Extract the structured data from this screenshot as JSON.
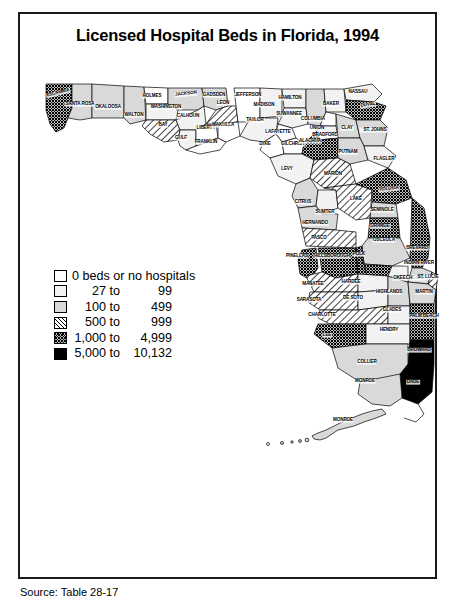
{
  "figure": {
    "title": "Licensed Hospital Beds in Florida, 1994",
    "source_note": "Source: Table 28-17"
  },
  "legend": {
    "name": "map-legend",
    "entries": [
      {
        "swatch": "white",
        "label": "0 beds or no hospitals",
        "from": "",
        "to": "",
        "single": true
      },
      {
        "swatch": "very-light-gray",
        "label": "27 to 99",
        "from": "27 to",
        "to": "99",
        "single": false
      },
      {
        "swatch": "light-gray",
        "label": "100 to 499",
        "from": "100 to",
        "to": "499",
        "single": false
      },
      {
        "swatch": "diagonal-hatch",
        "label": "500 to 999",
        "from": "500 to",
        "to": "999",
        "single": false
      },
      {
        "swatch": "crosshatch",
        "label": "1,000 to 4,999",
        "from": "1,000 to",
        "to": "4,999",
        "single": false
      },
      {
        "swatch": "black",
        "label": "5,000 to 10,132",
        "from": "5,000 to",
        "to": "10,132",
        "single": false
      }
    ]
  },
  "colors": {
    "class0": "#ffffff",
    "class1": "#f2f2f2",
    "class2": "#d9d9d9",
    "class5": "#000000",
    "border": "#1a1a1a"
  },
  "chart_data": {
    "type": "map",
    "title": "Licensed Hospital Beds in Florida, 1994",
    "region": "Florida",
    "unit": "licensed hospital beds",
    "classes": [
      {
        "index": 0,
        "range": "0 beds or no hospitals",
        "min": 0,
        "max": 0,
        "fill": "white"
      },
      {
        "index": 1,
        "range": "27 to 99",
        "min": 27,
        "max": 99,
        "fill": "very-light-gray"
      },
      {
        "index": 2,
        "range": "100 to 499",
        "min": 100,
        "max": 499,
        "fill": "light-gray"
      },
      {
        "index": 3,
        "range": "500 to 999",
        "min": 500,
        "max": 999,
        "fill": "diagonal-hatch"
      },
      {
        "index": 4,
        "range": "1,000 to 4,999",
        "min": 1000,
        "max": 4999,
        "fill": "crosshatch"
      },
      {
        "index": 5,
        "range": "5,000 to 10,132",
        "min": 5000,
        "max": 10132,
        "fill": "black"
      }
    ],
    "counties": [
      {
        "name": "ESCAMBIA",
        "class": 4
      },
      {
        "name": "SANTA ROSA",
        "class": 2
      },
      {
        "name": "OKALOOSA",
        "class": 2
      },
      {
        "name": "WALTON",
        "class": 2
      },
      {
        "name": "HOLMES",
        "class": 0
      },
      {
        "name": "WASHINGTON",
        "class": 1
      },
      {
        "name": "JACKSON",
        "class": 2
      },
      {
        "name": "BAY",
        "class": 3
      },
      {
        "name": "CALHOUN",
        "class": 1
      },
      {
        "name": "GULF",
        "class": 1
      },
      {
        "name": "LIBERTY",
        "class": 0
      },
      {
        "name": "FRANKLIN",
        "class": 0
      },
      {
        "name": "GADSDEN",
        "class": 2
      },
      {
        "name": "LEON",
        "class": 3
      },
      {
        "name": "WAKULLA",
        "class": 0
      },
      {
        "name": "JEFFERSON",
        "class": 0
      },
      {
        "name": "MADISON",
        "class": 1
      },
      {
        "name": "TAYLOR",
        "class": 1
      },
      {
        "name": "HAMILTON",
        "class": 1
      },
      {
        "name": "SUWANNEE",
        "class": 1
      },
      {
        "name": "LAFAYETTE",
        "class": 0
      },
      {
        "name": "DIXIE",
        "class": 0
      },
      {
        "name": "COLUMBIA",
        "class": 2
      },
      {
        "name": "BAKER",
        "class": 1
      },
      {
        "name": "NASSAU",
        "class": 1
      },
      {
        "name": "DUVAL",
        "class": 4
      },
      {
        "name": "UNION",
        "class": 0
      },
      {
        "name": "BRADFORD",
        "class": 1
      },
      {
        "name": "CLAY",
        "class": 2
      },
      {
        "name": "ST. JOHNS",
        "class": 2
      },
      {
        "name": "ALACHUA",
        "class": 4
      },
      {
        "name": "GILCHRIST",
        "class": 0
      },
      {
        "name": "LEVY",
        "class": 1
      },
      {
        "name": "PUTNAM",
        "class": 2
      },
      {
        "name": "FLAGLER",
        "class": 1
      },
      {
        "name": "MARION",
        "class": 3
      },
      {
        "name": "CITRUS",
        "class": 2
      },
      {
        "name": "SUMTER",
        "class": 1
      },
      {
        "name": "HERNANDO",
        "class": 2
      },
      {
        "name": "LAKE",
        "class": 3
      },
      {
        "name": "VOLUSIA",
        "class": 4
      },
      {
        "name": "SEMINOLE",
        "class": 2
      },
      {
        "name": "ORANGE",
        "class": 4
      },
      {
        "name": "OSCEOLA",
        "class": 2
      },
      {
        "name": "PASCO",
        "class": 3
      },
      {
        "name": "PINELLAS",
        "class": 4
      },
      {
        "name": "HILLSBOROUGH",
        "class": 4
      },
      {
        "name": "POLK",
        "class": 4
      },
      {
        "name": "BREVARD",
        "class": 4
      },
      {
        "name": "INDIAN RIVER",
        "class": 2
      },
      {
        "name": "OKEECHOBEE",
        "class": 1
      },
      {
        "name": "ST. LUCIE",
        "class": 3
      },
      {
        "name": "MARTIN",
        "class": 2
      },
      {
        "name": "MANATEE",
        "class": 3
      },
      {
        "name": "SARASOTA",
        "class": 3
      },
      {
        "name": "HARDEE",
        "class": 1
      },
      {
        "name": "DE SOTO",
        "class": 1
      },
      {
        "name": "HIGHLANDS",
        "class": 2
      },
      {
        "name": "CHARLOTTE",
        "class": 3
      },
      {
        "name": "GLADES",
        "class": 1
      },
      {
        "name": "LEE",
        "class": 4
      },
      {
        "name": "HENDRY",
        "class": 1
      },
      {
        "name": "PALM BEACH",
        "class": 4
      },
      {
        "name": "BROWARD",
        "class": 5
      },
      {
        "name": "COLLIER",
        "class": 2
      },
      {
        "name": "DADE",
        "class": 5
      },
      {
        "name": "MONROE",
        "class": 2
      }
    ]
  },
  "map_labels": [
    {
      "name": "ESCAMBIA",
      "x": 38,
      "y": 31,
      "rot": -14
    },
    {
      "name": "SANTA ROSA",
      "x": 60,
      "y": 42,
      "rot": 0,
      "two": true
    },
    {
      "name": "OKALOOSA",
      "x": 88,
      "y": 45,
      "rot": 0
    },
    {
      "name": "WALTON",
      "x": 114,
      "y": 53,
      "rot": 0
    },
    {
      "name": "HOLMES",
      "x": 132,
      "y": 34,
      "rot": 0
    },
    {
      "name": "WASHINGTON",
      "x": 146,
      "y": 45,
      "rot": 0
    },
    {
      "name": "JACKSON",
      "x": 166,
      "y": 32,
      "rot": -6
    },
    {
      "name": "CALHOUN",
      "x": 168,
      "y": 54,
      "rot": 0
    },
    {
      "name": "BAY",
      "x": 143,
      "y": 63,
      "rot": 0
    },
    {
      "name": "GULF",
      "x": 161,
      "y": 76,
      "rot": 0
    },
    {
      "name": "LIBERTY",
      "x": 186,
      "y": 66,
      "rot": 0
    },
    {
      "name": "FRANKLIN",
      "x": 186,
      "y": 80,
      "rot": 0
    },
    {
      "name": "GADSDEN",
      "x": 194,
      "y": 33,
      "rot": 0
    },
    {
      "name": "LEON",
      "x": 203,
      "y": 41,
      "rot": 0
    },
    {
      "name": "WAKULLA",
      "x": 203,
      "y": 63,
      "rot": 0
    },
    {
      "name": "JEFFERSON",
      "x": 228,
      "y": 33,
      "rot": 0
    },
    {
      "name": "MADISON",
      "x": 244,
      "y": 43,
      "rot": 0
    },
    {
      "name": "HAMILTON",
      "x": 270,
      "y": 36,
      "rot": 0
    },
    {
      "name": "TAYLOR",
      "x": 235,
      "y": 58,
      "rot": 0
    },
    {
      "name": "SUWANNEE",
      "x": 269,
      "y": 52,
      "rot": 0
    },
    {
      "name": "LAFAYETTE",
      "x": 258,
      "y": 70,
      "rot": 0
    },
    {
      "name": "COLUMBIA",
      "x": 293,
      "y": 57,
      "rot": 0
    },
    {
      "name": "DIXIE",
      "x": 245,
      "y": 82,
      "rot": 0
    },
    {
      "name": "GILCHRIST",
      "x": 273,
      "y": 82,
      "rot": 0
    },
    {
      "name": "BAKER",
      "x": 311,
      "y": 42,
      "rot": 0
    },
    {
      "name": "NASSAU",
      "x": 338,
      "y": 30,
      "rot": 0
    },
    {
      "name": "DUVAL",
      "x": 348,
      "y": 43,
      "rot": -8
    },
    {
      "name": "UNION",
      "x": 297,
      "y": 66,
      "rot": 0
    },
    {
      "name": "BRADFORD",
      "x": 305,
      "y": 73,
      "rot": 0
    },
    {
      "name": "ALACHUA",
      "x": 290,
      "y": 79,
      "rot": 0
    },
    {
      "name": "CLAY",
      "x": 327,
      "y": 66,
      "rot": 0
    },
    {
      "name": "ST. JOHNS",
      "x": 355,
      "y": 68,
      "rot": 0,
      "two": true
    },
    {
      "name": "PUTNAM",
      "x": 328,
      "y": 90,
      "rot": 0
    },
    {
      "name": "FLAGLER",
      "x": 364,
      "y": 97,
      "rot": 0
    },
    {
      "name": "LEVY",
      "x": 267,
      "y": 107,
      "rot": 0
    },
    {
      "name": "MARION",
      "x": 313,
      "y": 112,
      "rot": 0
    },
    {
      "name": "CITRUS",
      "x": 283,
      "y": 140,
      "rot": 0
    },
    {
      "name": "SUMTER",
      "x": 305,
      "y": 150,
      "rot": 0
    },
    {
      "name": "HERNANDO",
      "x": 295,
      "y": 161,
      "rot": 0
    },
    {
      "name": "LAKE",
      "x": 336,
      "y": 137,
      "rot": 0
    },
    {
      "name": "VOLUSIA",
      "x": 369,
      "y": 127,
      "rot": -6
    },
    {
      "name": "SEMINOLE",
      "x": 362,
      "y": 148,
      "rot": 0
    },
    {
      "name": "ORANGE",
      "x": 360,
      "y": 164,
      "rot": 0
    },
    {
      "name": "OSCEOLA",
      "x": 364,
      "y": 178,
      "rot": 0
    },
    {
      "name": "PASCO",
      "x": 299,
      "y": 176,
      "rot": 0
    },
    {
      "name": "PINELLAS",
      "x": 277,
      "y": 194,
      "rot": 0
    },
    {
      "name": "HILLSBOROUGH",
      "x": 312,
      "y": 194,
      "rot": 0
    },
    {
      "name": "POLK",
      "x": 339,
      "y": 192,
      "rot": 0
    },
    {
      "name": "BREVARD",
      "x": 397,
      "y": 186,
      "rot": 0
    },
    {
      "name": "INDIAN RIVER",
      "x": 399,
      "y": 201,
      "rot": 0,
      "two": true
    },
    {
      "name": "MANATEE",
      "x": 293,
      "y": 222,
      "rot": 0
    },
    {
      "name": "HARDEE",
      "x": 331,
      "y": 220,
      "rot": 0
    },
    {
      "name": "SARASOTA",
      "x": 289,
      "y": 238,
      "rot": 0
    },
    {
      "name": "DE SOTO",
      "x": 333,
      "y": 236,
      "rot": 0
    },
    {
      "name": "HIGHLANDS",
      "x": 369,
      "y": 230,
      "rot": 0
    },
    {
      "name": "OKEECHOBEE",
      "x": 389,
      "y": 216,
      "rot": 0
    },
    {
      "name": "ST. LUCIE",
      "x": 408,
      "y": 215,
      "rot": 0,
      "two": true
    },
    {
      "name": "MARTIN",
      "x": 404,
      "y": 230,
      "rot": 0
    },
    {
      "name": "CHARLOTTE",
      "x": 302,
      "y": 253,
      "rot": 0
    },
    {
      "name": "GLADES",
      "x": 372,
      "y": 248,
      "rot": 0
    },
    {
      "name": "LEE",
      "x": 307,
      "y": 273,
      "rot": 0
    },
    {
      "name": "HENDRY",
      "x": 369,
      "y": 268,
      "rot": 0
    },
    {
      "name": "PALM BEACH",
      "x": 404,
      "y": 254,
      "rot": 0
    },
    {
      "name": "BROWARD",
      "x": 399,
      "y": 288,
      "rot": 0
    },
    {
      "name": "COLLIER",
      "x": 347,
      "y": 300,
      "rot": 0
    },
    {
      "name": "DADE",
      "x": 393,
      "y": 320,
      "rot": 0
    },
    {
      "name": "MONROE",
      "x": 345,
      "y": 319,
      "rot": 0
    },
    {
      "name": "MONROE",
      "x": 323,
      "y": 358,
      "rot": 0
    }
  ]
}
